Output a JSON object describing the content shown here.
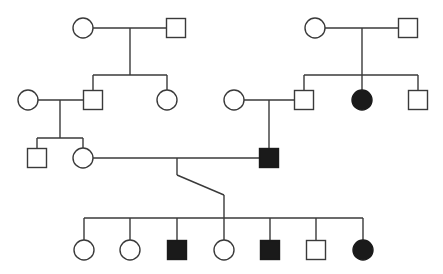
{
  "diagram": {
    "type": "pedigree",
    "colors": {
      "line": "#3a3a3a",
      "affected_fill": "#1a1a1a",
      "unaffected_fill": "#ffffff",
      "background": "#ffffff"
    },
    "legend": {
      "circle": "female",
      "square": "male",
      "filled": "affected",
      "open": "unaffected"
    },
    "generations": [
      {
        "label": "I",
        "individuals": [
          {
            "id": "I-1",
            "sex": "female",
            "affected": false,
            "cx": 83,
            "cy": 28
          },
          {
            "id": "I-2",
            "sex": "male",
            "affected": false,
            "cx": 176,
            "cy": 28
          },
          {
            "id": "I-3",
            "sex": "female",
            "affected": false,
            "cx": 315,
            "cy": 28
          },
          {
            "id": "I-4",
            "sex": "male",
            "affected": false,
            "cx": 408,
            "cy": 28
          }
        ]
      },
      {
        "label": "II",
        "individuals": [
          {
            "id": "II-1",
            "sex": "female",
            "affected": false,
            "cx": 28,
            "cy": 100
          },
          {
            "id": "II-2",
            "sex": "male",
            "affected": false,
            "cx": 93,
            "cy": 100
          },
          {
            "id": "II-3",
            "sex": "female",
            "affected": false,
            "cx": 167,
            "cy": 100
          },
          {
            "id": "II-4",
            "sex": "female",
            "affected": false,
            "cx": 234,
            "cy": 100
          },
          {
            "id": "II-5",
            "sex": "male",
            "affected": false,
            "cx": 304,
            "cy": 100
          },
          {
            "id": "II-6",
            "sex": "female",
            "affected": true,
            "cx": 362,
            "cy": 100
          },
          {
            "id": "II-7",
            "sex": "male",
            "affected": false,
            "cx": 418,
            "cy": 100
          }
        ]
      },
      {
        "label": "III",
        "individuals": [
          {
            "id": "III-1",
            "sex": "male",
            "affected": false,
            "cx": 37,
            "cy": 158
          },
          {
            "id": "III-2",
            "sex": "female",
            "affected": false,
            "cx": 83,
            "cy": 158
          },
          {
            "id": "III-3",
            "sex": "male",
            "affected": true,
            "cx": 269,
            "cy": 158
          }
        ]
      },
      {
        "label": "IV",
        "individuals": [
          {
            "id": "IV-1",
            "sex": "female",
            "affected": false,
            "cx": 84,
            "cy": 250
          },
          {
            "id": "IV-2",
            "sex": "female",
            "affected": false,
            "cx": 130,
            "cy": 250
          },
          {
            "id": "IV-3",
            "sex": "male",
            "affected": true,
            "cx": 177,
            "cy": 250
          },
          {
            "id": "IV-4",
            "sex": "female",
            "affected": false,
            "cx": 224,
            "cy": 250
          },
          {
            "id": "IV-5",
            "sex": "male",
            "affected": true,
            "cx": 270,
            "cy": 250
          },
          {
            "id": "IV-6",
            "sex": "male",
            "affected": false,
            "cx": 316,
            "cy": 250
          },
          {
            "id": "IV-7",
            "sex": "female",
            "affected": true,
            "cx": 363,
            "cy": 250
          }
        ]
      }
    ],
    "matings": [
      {
        "partners": [
          "I-1",
          "I-2"
        ],
        "children": [
          "II-2",
          "II-3"
        ]
      },
      {
        "partners": [
          "I-3",
          "I-4"
        ],
        "children": [
          "II-5",
          "II-6",
          "II-7"
        ]
      },
      {
        "partners": [
          "II-1",
          "II-2"
        ],
        "children": [
          "III-1",
          "III-2"
        ]
      },
      {
        "partners": [
          "II-4",
          "II-5"
        ],
        "children": [
          "III-3"
        ]
      },
      {
        "partners": [
          "III-2",
          "III-3"
        ],
        "children": [
          "IV-1",
          "IV-2",
          "IV-3",
          "IV-4",
          "IV-5",
          "IV-6",
          "IV-7"
        ]
      }
    ],
    "lines": [
      [
        [
          93,
          28
        ],
        [
          166,
          28
        ]
      ],
      [
        [
          130,
          28
        ],
        [
          130,
          75
        ]
      ],
      [
        [
          93,
          75
        ],
        [
          167,
          75
        ]
      ],
      [
        [
          93,
          75
        ],
        [
          93,
          90
        ]
      ],
      [
        [
          167,
          75
        ],
        [
          167,
          90
        ]
      ],
      [
        [
          325,
          28
        ],
        [
          398,
          28
        ]
      ],
      [
        [
          362,
          28
        ],
        [
          362,
          75
        ]
      ],
      [
        [
          304,
          75
        ],
        [
          418,
          75
        ]
      ],
      [
        [
          304,
          75
        ],
        [
          304,
          90
        ]
      ],
      [
        [
          362,
          75
        ],
        [
          362,
          90
        ]
      ],
      [
        [
          418,
          75
        ],
        [
          418,
          90
        ]
      ],
      [
        [
          38,
          100
        ],
        [
          83,
          100
        ]
      ],
      [
        [
          60,
          100
        ],
        [
          60,
          138
        ]
      ],
      [
        [
          37,
          138
        ],
        [
          83,
          138
        ]
      ],
      [
        [
          37,
          138
        ],
        [
          37,
          148
        ]
      ],
      [
        [
          83,
          138
        ],
        [
          83,
          148
        ]
      ],
      [
        [
          244,
          100
        ],
        [
          294,
          100
        ]
      ],
      [
        [
          269,
          100
        ],
        [
          269,
          148
        ]
      ],
      [
        [
          93,
          158
        ],
        [
          259,
          158
        ]
      ],
      [
        [
          177,
          158
        ],
        [
          177,
          175
        ]
      ],
      [
        [
          177,
          175
        ],
        [
          224,
          195
        ]
      ],
      [
        [
          224,
          195
        ],
        [
          224,
          218
        ]
      ],
      [
        [
          84,
          218
        ],
        [
          363,
          218
        ]
      ],
      [
        [
          84,
          218
        ],
        [
          84,
          240
        ]
      ],
      [
        [
          130,
          218
        ],
        [
          130,
          240
        ]
      ],
      [
        [
          177,
          218
        ],
        [
          177,
          240
        ]
      ],
      [
        [
          224,
          218
        ],
        [
          224,
          240
        ]
      ],
      [
        [
          270,
          218
        ],
        [
          270,
          240
        ]
      ],
      [
        [
          316,
          218
        ],
        [
          316,
          240
        ]
      ],
      [
        [
          363,
          218
        ],
        [
          363,
          240
        ]
      ]
    ]
  }
}
